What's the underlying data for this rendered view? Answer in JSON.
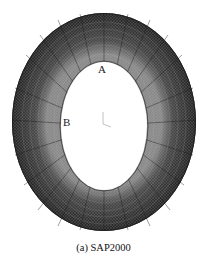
{
  "figure": {
    "type": "finite-element mesh of elliptical ring (tunnel lining) — top view",
    "points": {
      "a": "A",
      "b": "B"
    },
    "caption": "(a) SAP2000",
    "colors": {
      "mesh_dark": "#2e2e2e",
      "mesh_mid": "#555555",
      "mesh_light": "#9a9a9a",
      "background": "#ffffff"
    }
  }
}
